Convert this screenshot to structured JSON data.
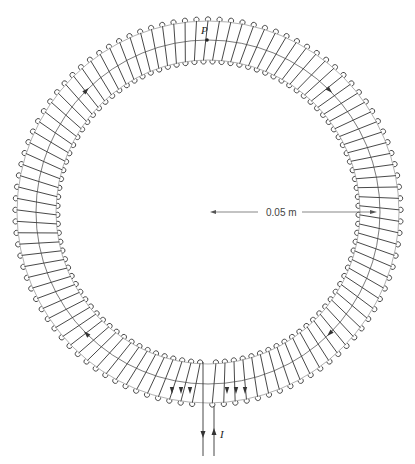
{
  "diagram": {
    "type": "toroidal-coil",
    "center": [
      208,
      212
    ],
    "inner_radius": 149,
    "mid_radius": 172,
    "outer_radius": 194,
    "turns": 104,
    "gap_angle_deg": 6,
    "stroke_color": "#333333",
    "labels": {
      "point": "P",
      "current": "I",
      "dimension": "0.05 m"
    },
    "arrows_on_mid_circle_deg": [
      -135,
      -45,
      45,
      135
    ],
    "bottom_arrows_count": 6
  }
}
